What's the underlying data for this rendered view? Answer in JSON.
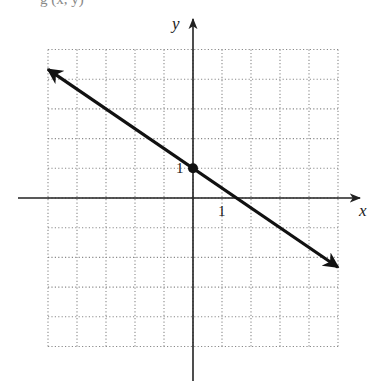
{
  "top_fragment": "g    (x, y)",
  "chart_data": {
    "type": "line",
    "title": "",
    "xlabel": "x",
    "ylabel": "y",
    "xlim": [
      -5,
      5
    ],
    "ylim": [
      -5,
      5
    ],
    "grid": true,
    "grid_style": "dotted",
    "grid_step": 1,
    "tick_labels": [
      {
        "axis": "x",
        "value": 1,
        "text": "1"
      },
      {
        "axis": "y",
        "value": 1,
        "text": "1"
      }
    ],
    "series": [
      {
        "name": "line",
        "equation": "y = -2/3 x + 1",
        "slope": -0.6667,
        "intercept": 1,
        "x": [
          -5,
          5
        ],
        "y": [
          4.33,
          -2.33
        ],
        "arrows_both_ends": true
      }
    ],
    "points": [
      {
        "x": 0,
        "y": 1,
        "label": "y-intercept",
        "marker": "filled-circle"
      }
    ]
  },
  "colors": {
    "line": "#111111",
    "grid": "#8a8a8a",
    "axes": "#222222"
  }
}
